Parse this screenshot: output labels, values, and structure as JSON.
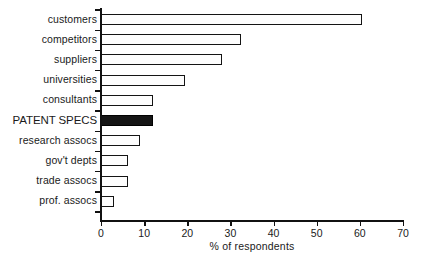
{
  "chart_data": {
    "type": "bar",
    "orientation": "horizontal",
    "title": "",
    "subtitle": "",
    "xlabel": "% of respondents",
    "ylabel": "",
    "xlim": [
      0,
      70
    ],
    "xticks": [
      0,
      10,
      20,
      30,
      40,
      50,
      60,
      70
    ],
    "grid": false,
    "legend": null,
    "categories": [
      "customers",
      "competitors",
      "suppliers",
      "universities",
      "consultants",
      "PATENT SPECS",
      "research assocs",
      "gov't depts",
      "trade assocs",
      "prof. assocs"
    ],
    "values": [
      60.5,
      32.5,
      28,
      19.5,
      12,
      12,
      9,
      6.3,
      6.3,
      3
    ],
    "bars": [
      {
        "label": "customers",
        "value": 60.5,
        "highlight": false,
        "color": "#fdfdfd"
      },
      {
        "label": "competitors",
        "value": 32.5,
        "highlight": false,
        "color": "#fdfdfd"
      },
      {
        "label": "suppliers",
        "value": 28,
        "highlight": false,
        "color": "#fdfdfd"
      },
      {
        "label": "universities",
        "value": 19.5,
        "highlight": false,
        "color": "#fdfdfd"
      },
      {
        "label": "consultants",
        "value": 12,
        "highlight": false,
        "color": "#fdfdfd"
      },
      {
        "label": "PATENT SPECS",
        "value": 12,
        "highlight": true,
        "color": "#151515"
      },
      {
        "label": "research assocs",
        "value": 9,
        "highlight": false,
        "color": "#fdfdfd"
      },
      {
        "label": "gov't depts",
        "value": 6.3,
        "highlight": false,
        "color": "#fdfdfd"
      },
      {
        "label": "trade assocs",
        "value": 6.3,
        "highlight": false,
        "color": "#fdfdfd"
      },
      {
        "label": "prof. assocs",
        "value": 3,
        "highlight": false,
        "color": "#fdfdfd"
      }
    ],
    "colors": {
      "bar_fill": "#fdfdfd",
      "bar_stroke": "#141414",
      "highlight_fill": "#151515",
      "axis": "#111111",
      "text": "#1a1a1a",
      "background": "#ffffff"
    }
  }
}
